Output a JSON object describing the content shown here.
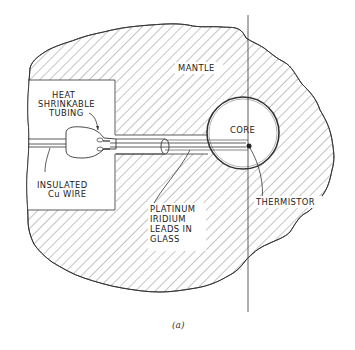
{
  "figure": {
    "caption": "(a)",
    "labels": {
      "mantle": "MANTLE",
      "core": "CORE",
      "heat_shrink": [
        "HEAT",
        "SHRINKABLE",
        "TUBING"
      ],
      "insulated_wire": [
        "INSULATED",
        "Cu WIRE"
      ],
      "platinum_leads": [
        "PLATINUM",
        "IRIDIUM",
        "LEADS IN",
        "GLASS"
      ],
      "thermistor": "THERMISTOR"
    },
    "colors": {
      "line": "#333333",
      "background": "#ffffff"
    }
  }
}
